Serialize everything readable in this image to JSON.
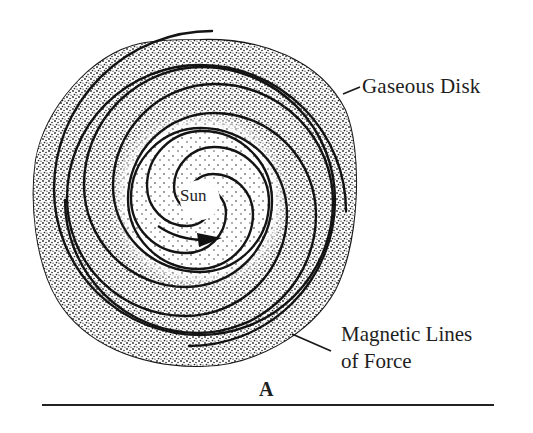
{
  "figure": {
    "panel_label": "A",
    "center_label": "Sun",
    "callouts": [
      {
        "text": "Gaseous Disk"
      },
      {
        "text_lines": [
          "Magnetic Lines",
          "of Force"
        ]
      }
    ],
    "colors": {
      "ink": "#1a1a1a",
      "stipple": "#2a2a2a",
      "background": "#ffffff"
    },
    "disk": {
      "center": [
        200,
        200
      ],
      "outer_radius": 160,
      "spiral_arms": 4,
      "rotation_arrow": "clockwise-tangent near Sun"
    }
  }
}
